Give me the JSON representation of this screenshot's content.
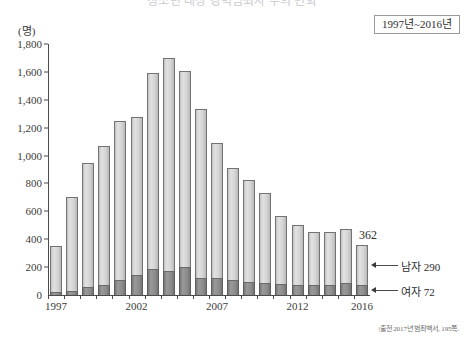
{
  "title": "청소년 대상 강력범죄자 수의 변화",
  "period_badge": "1997년~2016년",
  "y_unit": "(명)",
  "source_note": "|출전 2017년 범죄백서, 195쪽.",
  "value_label_2016": "362",
  "callouts": {
    "male": "남자 290",
    "female": "여자 72"
  },
  "chart_data": {
    "type": "bar",
    "stacked": true,
    "title": "청소년 대상 강력범죄자 수의 변화",
    "xlabel": "",
    "ylabel": "(명)",
    "ylim": [
      0,
      1800
    ],
    "ytick_labels": [
      "0",
      "200",
      "400",
      "600",
      "800",
      "1,000",
      "1,200",
      "1,400",
      "1,600",
      "1,800"
    ],
    "ytick_values": [
      0,
      200,
      400,
      600,
      800,
      1000,
      1200,
      1400,
      1600,
      1800
    ],
    "grid": false,
    "legend_position": "annotation-right",
    "categories": [
      "1997",
      "1998",
      "1999",
      "2000",
      "2001",
      "2002",
      "2003",
      "2004",
      "2005",
      "2006",
      "2007",
      "2008",
      "2009",
      "2010",
      "2011",
      "2012",
      "2013",
      "2014",
      "2015",
      "2016"
    ],
    "xtick_labels": [
      "1997",
      "2002",
      "2007",
      "2012",
      "2016"
    ],
    "series": [
      {
        "name": "여자",
        "color": "#8c8c8c",
        "values": [
          20,
          30,
          55,
          75,
          110,
          140,
          190,
          175,
          200,
          120,
          120,
          105,
          90,
          85,
          80,
          75,
          75,
          70,
          85,
          72
        ]
      },
      {
        "name": "남자",
        "color": "#d8d8d8",
        "values": [
          330,
          670,
          895,
          995,
          1140,
          1140,
          1400,
          1525,
          1410,
          1215,
          970,
          805,
          735,
          650,
          485,
          430,
          375,
          380,
          390,
          290
        ]
      }
    ],
    "totals": [
      350,
      700,
      950,
      1070,
      1250,
      1280,
      1590,
      1700,
      1610,
      1335,
      1090,
      910,
      825,
      735,
      565,
      505,
      450,
      450,
      475,
      362
    ]
  }
}
